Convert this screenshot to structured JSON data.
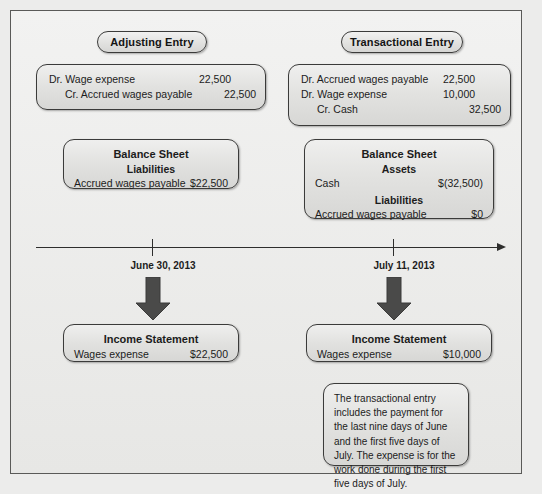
{
  "diagram": {
    "colors": {
      "background": "#ececeb",
      "box_border": "#3b3b3a",
      "box_fill": "#e2e2e0",
      "arrow": "#4a4a49",
      "timeline": "#2e2e2d",
      "text": "#1c1c1c"
    }
  },
  "left": {
    "header": "Adjusting Entry",
    "journal_entry": {
      "rows": [
        {
          "label": "Dr. Wage expense",
          "amount": "22,500",
          "indent": false,
          "amount_col": 1
        },
        {
          "label": "Cr. Accrued wages payable",
          "amount": "22,500",
          "indent": true,
          "amount_col": 2
        }
      ]
    },
    "balance_sheet": {
      "title": "Balance Sheet",
      "sections": [
        {
          "heading": "Liabilities",
          "lines": [
            {
              "label": "Accrued wages payable",
              "amount": "$22,500"
            }
          ]
        }
      ]
    },
    "date": "June 30, 2013",
    "income_statement": {
      "title": "Income Statement",
      "lines": [
        {
          "label": "Wages expense",
          "amount": "$22,500"
        }
      ]
    }
  },
  "right": {
    "header": "Transactional Entry",
    "journal_entry": {
      "rows": [
        {
          "label": "Dr. Accrued wages payable",
          "amount": "22,500",
          "indent": false,
          "amount_col": 1
        },
        {
          "label": "Dr. Wage expense",
          "amount": "10,000",
          "indent": false,
          "amount_col": 1
        },
        {
          "label": "Cr. Cash",
          "amount": "32,500",
          "indent": true,
          "amount_col": 2
        }
      ]
    },
    "balance_sheet": {
      "title": "Balance Sheet",
      "sections": [
        {
          "heading": "Assets",
          "lines": [
            {
              "label": "Cash",
              "amount": "$(32,500)"
            }
          ]
        },
        {
          "heading": "Liabilities",
          "lines": [
            {
              "label": "Accrued wages payable",
              "amount": "$0"
            }
          ]
        }
      ]
    },
    "date": "July 11, 2013",
    "income_statement": {
      "title": "Income Statement",
      "lines": [
        {
          "label": "Wages expense",
          "amount": "$10,000"
        }
      ]
    },
    "note": "The transactional entry includes the payment for the last nine days of June and the first five days of July. The expense is for the work done during the first five days of July."
  }
}
